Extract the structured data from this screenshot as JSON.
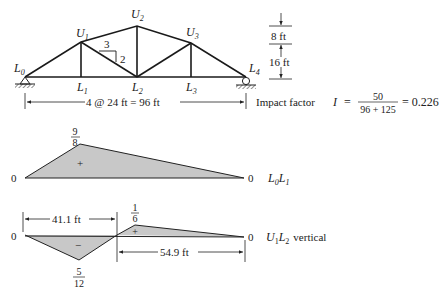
{
  "truss": {
    "nodes": {
      "L0": "L0",
      "L1": "L1",
      "L2": "L2",
      "L3": "L3",
      "L4": "L4",
      "U1": "U1",
      "U2": "U2",
      "U3": "U3"
    },
    "labels": {
      "L0": {
        "main": "L",
        "sub": "0"
      },
      "L1": {
        "main": "L",
        "sub": "1"
      },
      "L2": {
        "main": "L",
        "sub": "2"
      },
      "L3": {
        "main": "L",
        "sub": "3"
      },
      "L4": {
        "main": "L",
        "sub": "4"
      },
      "U1": {
        "main": "U",
        "sub": "1"
      },
      "U2": {
        "main": "U",
        "sub": "2"
      },
      "U3": {
        "main": "U",
        "sub": "3"
      }
    },
    "slope": {
      "run": "3",
      "rise": "2"
    },
    "height_dims": {
      "upper": "8 ft",
      "lower": "16 ft"
    },
    "span_dim": "4 @ 24 ft = 96 ft",
    "colors": {
      "members": "#1a1a1a",
      "fill": "#c8c8c8"
    }
  },
  "impact": {
    "label": "Impact factor",
    "symbol": "I",
    "eq": "=",
    "numerator": "50",
    "denominator": "96 + 125",
    "result": "= 0.226"
  },
  "influence_lines": [
    {
      "name": "L0L1",
      "label": {
        "main1": "L",
        "sub1": "0",
        "main2": "L",
        "sub2": "1"
      },
      "start_value": "0",
      "end_value": "0",
      "peak": {
        "num": "9",
        "den": "8"
      },
      "sign": "+"
    },
    {
      "name": "U1L2 vertical",
      "label": {
        "main1": "U",
        "sub1": "1",
        "main2": "L",
        "sub2": "2",
        "suffix": "vertical"
      },
      "start_value": "0",
      "end_value": "0",
      "neg_peak": {
        "num": "5",
        "den": "12"
      },
      "pos_peak": {
        "num": "1",
        "den": "6"
      },
      "neg_sign": "−",
      "pos_sign": "+",
      "dim_left": "41.1 ft",
      "dim_right": "54.9 ft"
    }
  ]
}
